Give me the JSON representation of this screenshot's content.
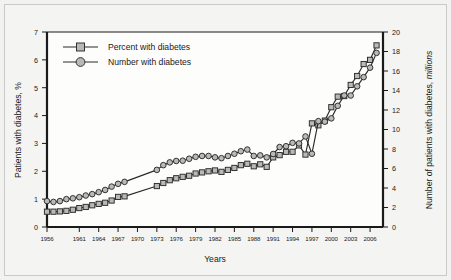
{
  "figure": {
    "background": "#f2f2f0",
    "plot_background": "#fdfdfc",
    "line_color": "#2b2b2b",
    "marker_fill": "#b9b9b9"
  },
  "chart_data": {
    "type": "line",
    "title": "",
    "xlabel": "Years",
    "ylabel": "Patients with diabetes, %",
    "ylabel_right": "Number of patients with diabetes, millions",
    "ylabel_right_plain": "Number of patients with diabetes, ",
    "ylabel_right_italic": "millions",
    "grid": false,
    "legend_position": "top-left",
    "xlim": [
      1956,
      2008
    ],
    "ylim": [
      0,
      7
    ],
    "ylim_right": [
      0,
      20
    ],
    "xticks": [
      1956,
      1961,
      1964,
      1967,
      1970,
      1973,
      1976,
      1979,
      1982,
      1985,
      1988,
      1991,
      1994,
      1997,
      2000,
      2003,
      2006
    ],
    "xtick_labels": [
      "1956",
      "1961",
      "1964",
      "1967",
      "1970",
      "1973",
      "1976",
      "1979",
      "1982",
      "1985",
      "1988",
      "1991",
      "1994",
      "1997",
      "2000",
      "2003",
      "2006"
    ],
    "yticks": [
      0,
      1,
      2,
      3,
      4,
      5,
      6,
      7
    ],
    "ytick_labels": [
      "0",
      "1",
      "2",
      "3",
      "4",
      "5",
      "6",
      "7"
    ],
    "yticks_right": [
      0,
      2,
      4,
      6,
      8,
      10,
      12,
      14,
      16,
      18,
      20
    ],
    "ytick_labels_right": [
      "0",
      "2",
      "4",
      "6",
      "8",
      "10",
      "12",
      "14",
      "16",
      "18",
      "20"
    ],
    "series": [
      {
        "name": "Percent with diabetes",
        "marker": "square",
        "axis": "left",
        "x": [
          1956,
          1957,
          1958,
          1959,
          1960,
          1961,
          1962,
          1963,
          1964,
          1965,
          1966,
          1967,
          1968,
          1973,
          1974,
          1975,
          1976,
          1977,
          1978,
          1979,
          1980,
          1981,
          1982,
          1983,
          1984,
          1985,
          1986,
          1987,
          1988,
          1989,
          1990,
          1991,
          1992,
          1993,
          1994,
          1995,
          1996,
          1997,
          1998,
          1999,
          2000,
          2001,
          2002,
          2003,
          2004,
          2005,
          2006,
          2007
        ],
        "values": [
          0.55,
          0.55,
          0.56,
          0.58,
          0.62,
          0.68,
          0.72,
          0.78,
          0.83,
          0.87,
          0.95,
          1.08,
          1.1,
          1.47,
          1.58,
          1.68,
          1.75,
          1.8,
          1.84,
          1.92,
          1.96,
          2.0,
          2.03,
          1.98,
          2.05,
          2.12,
          2.22,
          2.27,
          2.18,
          2.25,
          2.16,
          2.5,
          2.58,
          2.7,
          2.7,
          2.93,
          2.6,
          3.72,
          3.65,
          3.82,
          4.3,
          4.68,
          4.7,
          5.1,
          5.42,
          5.85,
          6.0,
          6.52
        ]
      },
      {
        "name": "Number with diabetes",
        "marker": "circle",
        "axis": "right",
        "x": [
          1956,
          1957,
          1958,
          1959,
          1960,
          1961,
          1962,
          1963,
          1964,
          1965,
          1966,
          1967,
          1968,
          1973,
          1974,
          1975,
          1976,
          1977,
          1978,
          1979,
          1980,
          1981,
          1982,
          1983,
          1984,
          1985,
          1986,
          1987,
          1988,
          1989,
          1990,
          1991,
          1992,
          1993,
          1994,
          1995,
          1996,
          1997,
          1998,
          1999,
          2000,
          2001,
          2002,
          2003,
          2004,
          2005,
          2006,
          2007
        ],
        "values_left_scale": [
          0.93,
          0.9,
          0.93,
          1.0,
          1.03,
          1.07,
          1.13,
          1.18,
          1.25,
          1.33,
          1.45,
          1.55,
          1.62,
          2.05,
          2.22,
          2.32,
          2.37,
          2.38,
          2.45,
          2.52,
          2.55,
          2.55,
          2.5,
          2.47,
          2.55,
          2.63,
          2.72,
          2.78,
          2.55,
          2.57,
          2.5,
          2.62,
          2.87,
          2.9,
          3.02,
          3.0,
          3.25,
          2.63,
          3.8,
          3.78,
          3.9,
          4.35,
          4.72,
          4.72,
          5.05,
          5.38,
          5.72,
          6.25
        ],
        "values_millions": [
          2.66,
          2.57,
          2.66,
          2.86,
          2.94,
          3.06,
          3.23,
          3.37,
          3.57,
          3.8,
          4.14,
          4.43,
          4.63,
          5.86,
          6.34,
          6.63,
          6.77,
          6.8,
          7.0,
          7.2,
          7.29,
          7.29,
          7.14,
          7.06,
          7.29,
          7.51,
          7.77,
          7.94,
          7.29,
          7.34,
          7.14,
          7.49,
          8.2,
          8.29,
          8.63,
          8.57,
          9.29,
          7.51,
          10.86,
          10.8,
          11.14,
          12.43,
          13.49,
          13.49,
          14.43,
          15.37,
          16.34,
          17.86
        ]
      }
    ]
  },
  "legend": {
    "items": [
      {
        "label": "Percent with diabetes",
        "marker": "square"
      },
      {
        "label": "Number with diabetes",
        "marker": "circle"
      }
    ]
  }
}
